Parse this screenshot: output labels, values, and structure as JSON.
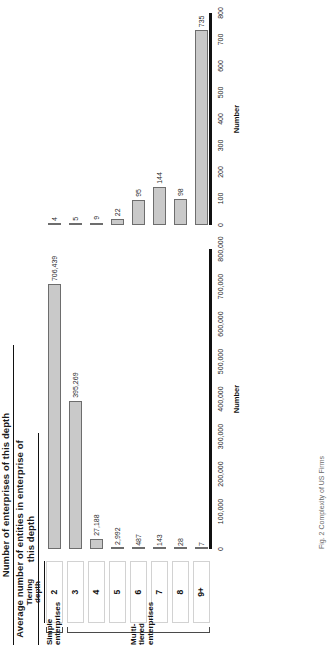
{
  "figure": {
    "caption_fragment": "Fig. 2  Complexity of US Firms"
  },
  "tier_table": {
    "header_line1": "Tiering",
    "header_line2": "depth",
    "cells": [
      "2",
      "3",
      "4",
      "5",
      "6",
      "7",
      "8",
      "9+"
    ]
  },
  "groups": [
    {
      "label_line1": "Simple",
      "label_line2": "enterprises",
      "from": 0,
      "to": 0
    },
    {
      "label_line1": "Multi-tiered",
      "label_line2": "enterprises",
      "from": 1,
      "to": 7
    }
  ],
  "chart_data": [
    {
      "type": "bar",
      "id": "enterprises-of-this-depth",
      "title": "Number of enterprises of this depth",
      "categories": [
        "2",
        "3",
        "4",
        "5",
        "6",
        "7",
        "8",
        "9+"
      ],
      "values": [
        706439,
        395269,
        27188,
        2992,
        487,
        143,
        28,
        7
      ],
      "value_labels": [
        "706,439",
        "395,269",
        "27,188",
        "2,992",
        "487",
        "143",
        "28",
        "7"
      ],
      "xlabel": "Tiering depth",
      "ylabel": "Number",
      "axis_name": "Number",
      "ylim": [
        0,
        800000
      ],
      "ticks": [
        0,
        100000,
        200000,
        300000,
        400000,
        500000,
        600000,
        700000,
        800000
      ],
      "tick_labels": [
        "0",
        "100,000",
        "200,000",
        "300,000",
        "400,000",
        "500,000",
        "600,000",
        "700,000",
        "800,000"
      ],
      "grid": false,
      "legend": "none",
      "orientation": "horizontal-bars"
    },
    {
      "type": "bar",
      "id": "avg-entities-per-enterprise",
      "title": "Average number of entities in enterprise of this depth",
      "categories": [
        "2",
        "3",
        "4",
        "5",
        "6",
        "7",
        "8",
        "9+"
      ],
      "values": [
        4,
        5,
        9,
        22,
        95,
        144,
        98,
        735
      ],
      "value_labels": [
        "4",
        "5",
        "9",
        "22",
        "95",
        "144",
        "98",
        "735"
      ],
      "xlabel": "Tiering depth",
      "ylabel": "Number",
      "axis_name": "Number",
      "ylim": [
        0,
        800
      ],
      "ticks": [
        0,
        100,
        200,
        300,
        400,
        500,
        600,
        700,
        800
      ],
      "tick_labels": [
        "0",
        "100",
        "200",
        "300",
        "400",
        "500",
        "600",
        "700",
        "800"
      ],
      "grid": false,
      "legend": "none",
      "orientation": "horizontal-bars"
    }
  ],
  "colors": {
    "bar_fill": "#c9c9c9",
    "bar_stroke": "#6d6d6d",
    "axis": "#111111",
    "text": "#1a1a1a"
  }
}
